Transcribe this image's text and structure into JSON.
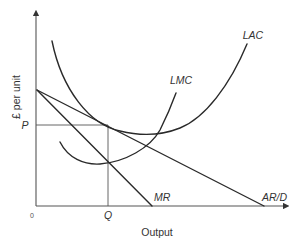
{
  "diagram": {
    "title": "",
    "y_axis_label": "£ per unit",
    "x_axis_label": "Output",
    "origin_label": "0",
    "price_label": "P",
    "quantity_label": "Q",
    "curves": [
      {
        "id": "lac",
        "label": "LAC",
        "description": "Long-run average cost, U-shaped"
      },
      {
        "id": "lmc",
        "label": "LMC",
        "description": "Long-run marginal cost, U-shaped, cuts LAC at its minimum"
      },
      {
        "id": "mr",
        "label": "MR",
        "description": "Marginal revenue, downward sloping, steeper than AR"
      },
      {
        "id": "ar",
        "label": "AR/D",
        "description": "Average revenue / demand, downward sloping"
      }
    ],
    "annotations": [
      "MR = LMC at output Q",
      "Price P read from AR/D at Q, tangent to LAC"
    ],
    "stroke_color": "#2a2a2a",
    "background_color": "#ffffff"
  }
}
